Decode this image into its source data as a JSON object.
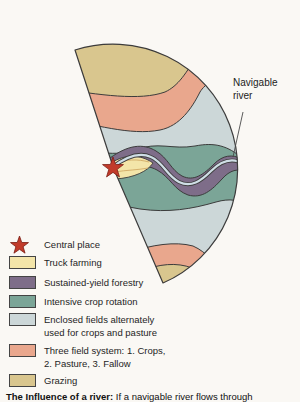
{
  "figure": {
    "annotation_label": "Navigable river",
    "caption_bold": "The Influence of a river:",
    "caption_rest": " If a navigable river flows through"
  },
  "legend": {
    "items": [
      {
        "label": "Central place",
        "key": "star"
      },
      {
        "label": "Truck farming",
        "key": "truck_farming"
      },
      {
        "label": "Sustained-yield forestry",
        "key": "forestry"
      },
      {
        "label": "Intensive crop rotation",
        "key": "intensive_crop"
      },
      {
        "label": "Enclosed fields alternately",
        "label2": "used for crops and pasture",
        "key": "enclosed_fields"
      },
      {
        "label": "Three field system:  1. Crops,",
        "label2": "2. Pasture,  3. Fallow",
        "key": "three_field"
      },
      {
        "label": "Grazing",
        "key": "grazing"
      }
    ]
  },
  "colors": {
    "central_place_star": "#c23b2a",
    "truck_farming": "#f3e5a9",
    "forestry": "#7e6d89",
    "intensive_crop": "#7ba597",
    "enclosed_fields": "#ccd7d8",
    "three_field": "#e9a78d",
    "grazing": "#d9c68e",
    "river": "#cfdee6",
    "outline": "#3c3c3c"
  }
}
